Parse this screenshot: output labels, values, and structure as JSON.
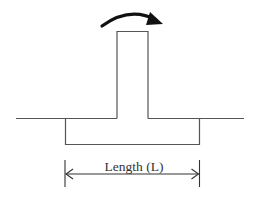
{
  "diagram": {
    "type": "footing-moment-diagram",
    "elements": {
      "moment_arrow": {
        "direction": "clockwise",
        "color": "#111111"
      },
      "column": {
        "color": "#555555"
      },
      "footing": {
        "color": "#555555"
      },
      "ground_line": {
        "color": "#555555"
      },
      "dimension": {
        "label": "Length (L)",
        "color": "#333333"
      }
    }
  }
}
